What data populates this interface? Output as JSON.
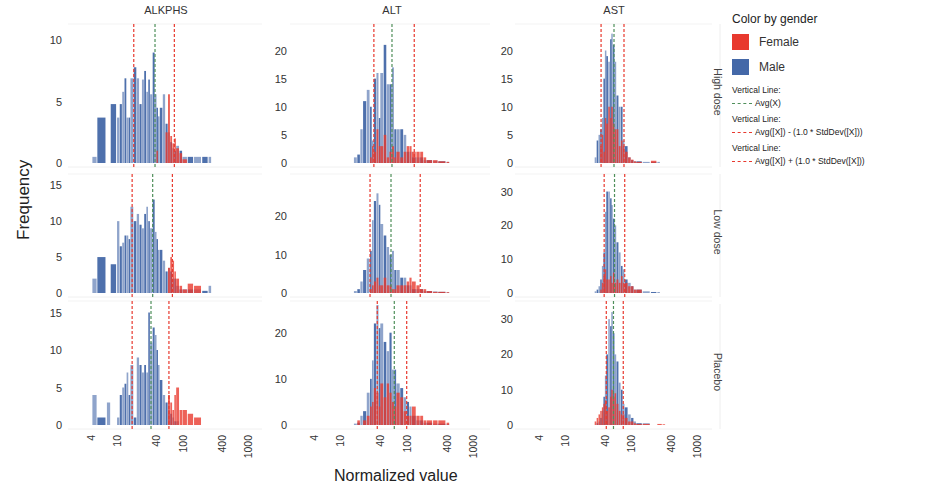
{
  "chart_data": {
    "type": "bar",
    "subtype": "trellis histogram (faceted)",
    "title": "",
    "xlabel": "Normalized value",
    "ylabel": "Frequency",
    "x_scale": "log",
    "x_ticks": [
      4,
      10,
      40,
      100,
      400,
      1000
    ],
    "grid": false,
    "legend_position": "right",
    "color_by": "gender",
    "legend": {
      "title": "Color by gender",
      "entries": [
        {
          "name": "Female",
          "color": "#e8392e"
        },
        {
          "name": "Male",
          "color": "#4468a8"
        }
      ],
      "reference_lines": [
        {
          "title": "Vertical Line:",
          "expr": "Avg(X)",
          "color": "#4f8f5a"
        },
        {
          "title": "Vertical Line:",
          "expr": "Avg([X]) - (1.0 * StdDev([X]))",
          "color": "#e8392e"
        },
        {
          "title": "Vertical Line:",
          "expr": "Avg([X]) + (1.0 * StdDev([X]))",
          "color": "#e8392e"
        }
      ]
    },
    "columns": [
      "ALKPHS",
      "ALT",
      "AST"
    ],
    "rows": [
      "High dose",
      "Low dose",
      "Placebo"
    ],
    "panels": [
      {
        "row": "High dose",
        "col": "ALKPHS",
        "y_ticks": [
          0,
          5,
          10
        ],
        "ylim": [
          0,
          11
        ],
        "avg": 38,
        "minus_sd": 18,
        "plus_sd": 75,
        "x": [
          4.2,
          5,
          7,
          8,
          10,
          11,
          12,
          13,
          14,
          15,
          16,
          18,
          20,
          22,
          24,
          26,
          28,
          30,
          32,
          35,
          38,
          40,
          42,
          45,
          50,
          55,
          60,
          65,
          70,
          75,
          80,
          90,
          100,
          120,
          150,
          200,
          250
        ],
        "male": [
          0.5,
          3.7,
          0,
          4.8,
          3.7,
          4.8,
          5.8,
          6.9,
          3.7,
          3.7,
          6.9,
          7.8,
          6.9,
          4.8,
          6.8,
          7.5,
          5.8,
          6.8,
          5.6,
          9,
          5.6,
          4.5,
          3.8,
          4.5,
          5.6,
          3.2,
          2.5,
          1.7,
          1.2,
          1,
          1.4,
          1,
          0.5,
          0.5,
          0.5,
          0.5,
          0.5
        ],
        "female": [
          0,
          0,
          0,
          0,
          0,
          0,
          0,
          0,
          0,
          0,
          0,
          0,
          0,
          0,
          0,
          0,
          0,
          0,
          0,
          0,
          0,
          1,
          0,
          0,
          0,
          2.5,
          5.6,
          2.2,
          1.6,
          2,
          1.2,
          0.8,
          0.3,
          0,
          0,
          0,
          0
        ]
      },
      {
        "row": "High dose",
        "col": "ALT",
        "y_ticks": [
          0,
          5,
          10,
          15,
          20
        ],
        "ylim": [
          0,
          24
        ],
        "avg": 60,
        "minus_sd": 32,
        "plus_sd": 130,
        "x": [
          16,
          18,
          20,
          22,
          25,
          28,
          30,
          32,
          35,
          38,
          40,
          45,
          50,
          55,
          60,
          65,
          70,
          80,
          90,
          100,
          110,
          120,
          140,
          160,
          180,
          200,
          250,
          300,
          400
        ],
        "male": [
          1,
          1.5,
          6,
          11,
          13,
          10,
          4,
          15,
          16,
          8,
          16,
          21,
          14,
          14,
          17,
          6,
          6,
          6,
          5,
          2,
          2,
          1,
          1,
          1,
          0.5,
          0.5,
          0.4,
          0.3,
          0.2
        ],
        "female": [
          0,
          0,
          0,
          0,
          0,
          1,
          3,
          2,
          6,
          3,
          3,
          5,
          1,
          2,
          3,
          1,
          2,
          1,
          2,
          3,
          3,
          2,
          2,
          2,
          1,
          0.5,
          0.5,
          0.3,
          0.2
        ]
      },
      {
        "row": "High dose",
        "col": "AST",
        "y_ticks": [
          0,
          5,
          10,
          15,
          20
        ],
        "ylim": [
          0,
          24
        ],
        "avg": 55,
        "minus_sd": 35,
        "plus_sd": 78,
        "x": [
          28,
          30,
          32,
          34,
          36,
          38,
          40,
          42,
          45,
          48,
          50,
          53,
          56,
          60,
          65,
          70,
          75,
          80,
          90,
          100,
          110,
          120,
          150,
          200,
          250
        ],
        "male": [
          1,
          4,
          5,
          6,
          8,
          15,
          20,
          19,
          18,
          22,
          23,
          21,
          18,
          12,
          10,
          10,
          4,
          3,
          1,
          0.5,
          0.3,
          0.3,
          0.2,
          0.2,
          0.2
        ],
        "female": [
          0,
          0,
          0,
          3,
          5,
          2,
          8,
          7,
          10,
          8,
          10,
          7,
          6,
          6,
          3,
          4,
          3,
          2,
          1,
          0.6,
          0.3,
          0.2,
          0,
          0.4,
          0
        ]
      },
      {
        "row": "Low dose",
        "col": "ALKPHS",
        "y_ticks": [
          0,
          5,
          10,
          15
        ],
        "ylim": [
          0,
          16
        ],
        "avg": 35,
        "minus_sd": 17,
        "plus_sd": 70,
        "x": [
          4.2,
          5,
          7,
          8,
          10,
          11,
          12,
          13,
          14,
          15,
          16,
          18,
          20,
          22,
          24,
          26,
          28,
          30,
          32,
          35,
          38,
          40,
          42,
          45,
          50,
          55,
          60,
          65,
          70,
          75,
          80,
          90,
          100,
          120,
          150,
          200,
          250
        ],
        "male": [
          2,
          5,
          0,
          4,
          10,
          6.5,
          7,
          8,
          8,
          7.5,
          12,
          10,
          11,
          9.5,
          9,
          11,
          12,
          10,
          9,
          13,
          8.5,
          7.5,
          6,
          6,
          4.5,
          3,
          3.5,
          3,
          2,
          2,
          1,
          0.5,
          0.5,
          0.5,
          0.5,
          0.3,
          1
        ],
        "female": [
          0,
          0,
          0,
          0,
          0,
          0,
          0,
          0,
          0,
          0,
          0,
          0,
          0,
          0,
          0,
          0,
          0,
          0,
          0,
          0,
          0,
          0,
          0,
          0,
          0,
          0,
          3.5,
          5,
          4.5,
          3,
          2,
          1,
          0.5,
          1.3,
          1,
          0,
          0
        ]
      },
      {
        "row": "Low dose",
        "col": "ALT",
        "y_ticks": [
          0,
          10,
          20
        ],
        "ylim": [
          0,
          30
        ],
        "avg": 58,
        "minus_sd": 28,
        "plus_sd": 160,
        "x": [
          16,
          18,
          20,
          22,
          25,
          28,
          30,
          32,
          35,
          38,
          40,
          45,
          50,
          55,
          60,
          65,
          70,
          80,
          90,
          100,
          110,
          120,
          140,
          160,
          180,
          200,
          250,
          300,
          400
        ],
        "male": [
          0.5,
          1,
          3,
          6,
          9,
          11,
          19,
          24,
          26,
          23,
          18,
          15,
          12,
          10,
          11,
          6,
          6,
          4,
          4,
          2,
          2,
          1,
          1,
          1,
          0.5,
          0.5,
          0.4,
          0.3,
          0.2
        ],
        "female": [
          0,
          0,
          0,
          0,
          0,
          1,
          2,
          3,
          4,
          2,
          2,
          4,
          2,
          2,
          1,
          1,
          2,
          2,
          2,
          3,
          4,
          3,
          2,
          1,
          1,
          0.5,
          0.3,
          0.3,
          0.2
        ]
      },
      {
        "row": "Low dose",
        "col": "AST",
        "y_ticks": [
          0,
          10,
          20,
          30
        ],
        "ylim": [
          0,
          34
        ],
        "avg": 56,
        "minus_sd": 39,
        "plus_sd": 80,
        "x": [
          28,
          30,
          32,
          34,
          36,
          38,
          40,
          42,
          45,
          48,
          50,
          53,
          56,
          60,
          65,
          70,
          75,
          80,
          90,
          100,
          110,
          120,
          150,
          200,
          250
        ],
        "male": [
          0.5,
          1,
          2,
          4,
          8,
          12,
          24,
          30,
          30,
          28,
          26,
          22,
          20,
          15,
          12,
          8,
          7,
          4,
          3,
          2,
          1,
          1,
          0.5,
          0.3,
          0.3
        ],
        "female": [
          0,
          0,
          0,
          1,
          3,
          5,
          7,
          4,
          4,
          5,
          3,
          6,
          3,
          4,
          3,
          5,
          3,
          3,
          2,
          2,
          1,
          1,
          0,
          0,
          0
        ]
      },
      {
        "row": "Placebo",
        "col": "ALKPHS",
        "y_ticks": [
          0,
          5,
          10,
          15
        ],
        "ylim": [
          0,
          16
        ],
        "avg": 33,
        "minus_sd": 17,
        "plus_sd": 62,
        "x": [
          4.2,
          5,
          7,
          8,
          10,
          11,
          12,
          13,
          14,
          15,
          16,
          18,
          20,
          22,
          24,
          26,
          28,
          30,
          32,
          35,
          38,
          40,
          42,
          45,
          50,
          55,
          60,
          65,
          70,
          75,
          80,
          90,
          100,
          120,
          150,
          200,
          250
        ],
        "male": [
          4,
          1,
          3,
          0,
          1,
          4,
          5,
          5.5,
          7,
          4,
          8,
          1,
          9,
          8,
          7,
          8,
          7,
          15,
          11,
          13,
          12,
          10,
          8,
          6,
          4,
          3,
          2,
          1.5,
          1,
          0.5,
          0.5,
          0,
          0,
          0,
          0,
          0,
          0
        ],
        "female": [
          0,
          0,
          0,
          0,
          0,
          0,
          0,
          0,
          0,
          0,
          0,
          0,
          0,
          0,
          0,
          0,
          0,
          0,
          0,
          0,
          0,
          0,
          0,
          0,
          0,
          0,
          4,
          3,
          2,
          4,
          5,
          2,
          2,
          1.5,
          1,
          0,
          0
        ]
      },
      {
        "row": "Placebo",
        "col": "ALT",
        "y_ticks": [
          0,
          10,
          20
        ],
        "ylim": [
          0,
          26
        ],
        "avg": 65,
        "minus_sd": 36,
        "plus_sd": 100,
        "x": [
          16,
          18,
          20,
          22,
          25,
          28,
          30,
          32,
          35,
          38,
          40,
          45,
          50,
          55,
          60,
          65,
          70,
          80,
          90,
          100,
          110,
          120,
          140,
          160,
          180,
          200,
          250,
          300,
          400
        ],
        "male": [
          0.3,
          0.5,
          2,
          3,
          7,
          10,
          14,
          22,
          26,
          21,
          22,
          18,
          16,
          20,
          12,
          12,
          9,
          8,
          6,
          5,
          4,
          2,
          1,
          1,
          0.5,
          0.5,
          0.3,
          0.3,
          0.2
        ],
        "female": [
          0,
          1,
          0,
          1,
          2,
          4,
          5,
          8,
          7,
          4,
          9,
          6,
          9,
          7,
          5,
          4,
          7,
          6,
          3,
          2,
          2,
          4,
          2,
          2,
          1,
          1,
          1,
          1,
          0.5
        ]
      },
      {
        "row": "Placebo",
        "col": "AST",
        "y_ticks": [
          0,
          10,
          20,
          30
        ],
        "ylim": [
          0,
          34
        ],
        "avg": 54,
        "minus_sd": 42,
        "plus_sd": 76,
        "x": [
          28,
          30,
          32,
          34,
          36,
          38,
          40,
          42,
          45,
          48,
          50,
          53,
          56,
          60,
          65,
          70,
          75,
          80,
          90,
          100,
          110,
          120,
          150,
          200,
          250,
          300
        ],
        "male": [
          0,
          0.5,
          1,
          2,
          4,
          8,
          14,
          20,
          30,
          28,
          32,
          26,
          20,
          18,
          12,
          10,
          6,
          5,
          3,
          2,
          1,
          0.5,
          0.5,
          0,
          0,
          0
        ],
        "female": [
          1,
          2,
          3,
          4,
          5,
          6,
          7,
          4,
          5,
          8,
          10,
          8,
          9,
          6,
          4,
          3,
          3,
          2,
          1,
          1,
          0.5,
          0.3,
          0.3,
          0,
          0.3,
          0.2
        ]
      }
    ]
  },
  "labels": {
    "ylabel": "Frequency",
    "xlabel": "Normalized value"
  }
}
